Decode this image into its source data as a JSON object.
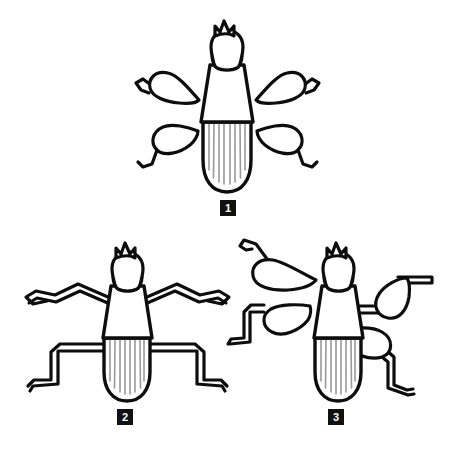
{
  "figure": {
    "type": "line-drawing",
    "background_color": "#ffffff",
    "stroke_color": "#0d0d0d",
    "fill_color": "#ffffff",
    "accent_gray": "#b3b3b3",
    "stripe_gray": "#999999",
    "badge_color": "#111111",
    "badge_text_color": "#ffffff",
    "panels": [
      {
        "id": "panel-1",
        "label": "1",
        "leg_style": "teardrop-femur-splayed",
        "leg_count": 4,
        "antenna_points": 3,
        "abdomen_stripes": 8,
        "description": "Insect viewed from above with four broad teardrop-shaped femora splayed outward and slender zig-zag tarsi"
      },
      {
        "id": "panel-2",
        "label": "2",
        "leg_style": "thin-zigzag",
        "leg_count": 4,
        "antenna_points": 3,
        "abdomen_stripes": 8,
        "description": "Insect viewed from above with four slender outlined zig-zag legs and no thickened femora"
      },
      {
        "id": "panel-3",
        "label": "3",
        "leg_style": "teardrop-femur-angled",
        "leg_count": 4,
        "antenna_points": 3,
        "abdomen_stripes": 8,
        "description": "Insect viewed from above with four large teardrop femora angled rearward and straight bent tarsi"
      }
    ]
  }
}
